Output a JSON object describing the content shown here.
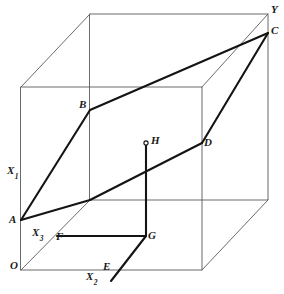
{
  "figure": {
    "background_color": "#ffffff",
    "ink_color": "#1a1a1a",
    "thin_line_color": "#5a5a5a",
    "width": 284,
    "height": 294
  },
  "axes": {
    "x1": {
      "text": "X",
      "subscript": "1",
      "x": 8,
      "y": 166
    },
    "x2": {
      "text": "X",
      "subscript": "2",
      "x": 87,
      "y": 272
    },
    "x3": {
      "text": "X",
      "subscript": "3",
      "x": 33,
      "y": 228
    },
    "y": {
      "text": "Y",
      "subscript": "",
      "x": 272,
      "y": 5
    }
  },
  "points": [
    {
      "id": "O",
      "label": "O",
      "x": 21,
      "y": 267,
      "label_x": 10,
      "label_y": 262,
      "marker": "none"
    },
    {
      "id": "A",
      "label": "A",
      "x": 21,
      "y": 220,
      "label_x": 9,
      "label_y": 219,
      "marker": "none"
    },
    {
      "id": "B",
      "label": "B",
      "x": 90,
      "y": 110,
      "label_x": 79,
      "label_y": 100,
      "marker": "none"
    },
    {
      "id": "C",
      "label": "C",
      "x": 268,
      "y": 33,
      "label_x": 272,
      "label_y": 25,
      "marker": "none"
    },
    {
      "id": "D",
      "label": "D",
      "x": 202,
      "y": 143,
      "label_x": 205,
      "label_y": 138,
      "marker": "none"
    },
    {
      "id": "E",
      "label": "E",
      "x": 118,
      "y": 272,
      "label_x": 104,
      "label_y": 261,
      "marker": "none"
    },
    {
      "id": "F",
      "label": "F",
      "x": 57,
      "y": 237,
      "label_x": 57,
      "label_y": 232,
      "marker": "none"
    },
    {
      "id": "G",
      "label": "G",
      "x": 146,
      "y": 236,
      "label_x": 148,
      "label_y": 230,
      "marker": "none"
    },
    {
      "id": "H",
      "label": "H",
      "x": 146,
      "y": 143,
      "label_x": 151,
      "label_y": 135,
      "marker": "open-circle"
    }
  ],
  "cube": {
    "description": "Outer box drawn in light strokes, oblique projection",
    "front_face": {
      "left": 21,
      "right": 202,
      "top": 87,
      "bottom": 270
    },
    "back_face": {
      "left": 90,
      "right": 268,
      "top": 14,
      "bottom": 200
    },
    "connectors": [
      {
        "from": [
          21,
          87
        ],
        "to": [
          90,
          14
        ]
      },
      {
        "from": [
          202,
          87
        ],
        "to": [
          268,
          14
        ]
      },
      {
        "from": [
          21,
          270
        ],
        "to": [
          90,
          200
        ]
      },
      {
        "from": [
          202,
          270
        ],
        "to": [
          268,
          200
        ]
      }
    ]
  },
  "plane_outline": {
    "description": "Thick quadrilateral A-B-C-D representing a plane slicing the cube",
    "vertices": [
      [
        21,
        220
      ],
      [
        90,
        110
      ],
      [
        268,
        33
      ],
      [
        202,
        143
      ]
    ]
  },
  "thick_segments": [
    {
      "name": "A-to-plane-edge",
      "from": [
        21,
        220
      ],
      "to": [
        90,
        200
      ]
    },
    {
      "name": "plane-edge-to-C",
      "from": [
        90,
        200
      ],
      "to": [
        268,
        33
      ]
    },
    {
      "name": "F-to-G",
      "from": [
        57,
        237
      ],
      "to": [
        146,
        236
      ]
    },
    {
      "name": "G-to-H",
      "from": [
        146,
        236
      ],
      "to": [
        146,
        143
      ]
    },
    {
      "name": "E-to-G",
      "from": [
        111,
        280
      ],
      "to": [
        146,
        236
      ]
    }
  ]
}
